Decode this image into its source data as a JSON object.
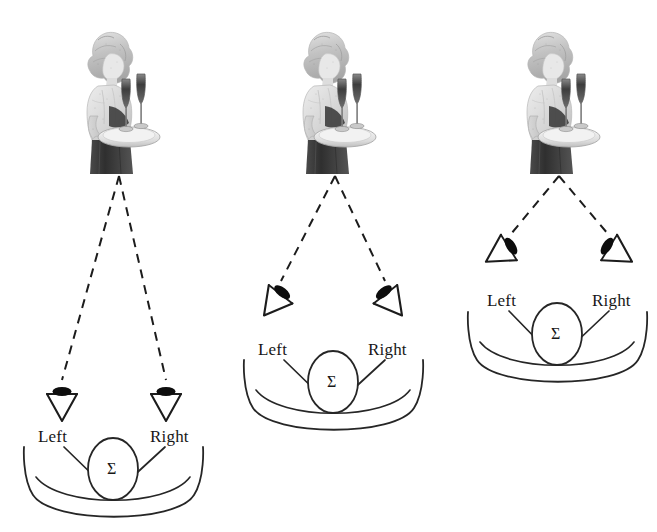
{
  "figure": {
    "background_color": "#ffffff",
    "ink_color": "#1c1c1c",
    "width": 657,
    "height": 532
  },
  "panels": [
    {
      "id": "panel-spaced-pair",
      "source": {
        "icon": "waitress-with-champagne-tray-photo",
        "x": 76,
        "y": 24,
        "w": 86,
        "h": 150,
        "apex_x": 119,
        "apex_y": 176
      },
      "mics": [
        {
          "side": "left",
          "label": "Left",
          "x": 62,
          "y": 395,
          "rotation_deg": 0
        },
        {
          "side": "right",
          "label": "Right",
          "x": 166,
          "y": 395,
          "rotation_deg": 0
        }
      ],
      "labels": {
        "left": {
          "text": "Left",
          "x": 38,
          "y": 427
        },
        "right": {
          "text": "Right",
          "x": 150,
          "y": 427
        }
      },
      "summing": {
        "symbol": "Σ",
        "cx": 113,
        "cy": 469,
        "rx": 25,
        "ry": 31
      },
      "listener_arc": {
        "cx": 113,
        "cy": 466,
        "rx": 90,
        "ry": 52
      }
    },
    {
      "id": "panel-near-coincident-pair",
      "source": {
        "icon": "waitress-with-champagne-tray-photo",
        "x": 292,
        "y": 24,
        "w": 86,
        "h": 150,
        "apex_x": 335,
        "apex_y": 176
      },
      "mics": [
        {
          "side": "left",
          "label": "Left",
          "x": 280,
          "y": 295,
          "rotation_deg": 38
        },
        {
          "side": "right",
          "label": "Right",
          "x": 386,
          "y": 295,
          "rotation_deg": -38
        }
      ],
      "labels": {
        "left": {
          "text": "Left",
          "x": 258,
          "y": 340
        },
        "right": {
          "text": "Right",
          "x": 368,
          "y": 340
        }
      },
      "summing": {
        "symbol": "Σ",
        "cx": 333,
        "cy": 382,
        "rx": 25,
        "ry": 31
      },
      "listener_arc": {
        "cx": 333,
        "cy": 379,
        "rx": 90,
        "ry": 52
      }
    },
    {
      "id": "panel-coincident-pair",
      "source": {
        "icon": "waitress-with-champagne-tray-photo",
        "x": 516,
        "y": 24,
        "w": 86,
        "h": 150,
        "apex_x": 559,
        "apex_y": 176
      },
      "mics": [
        {
          "side": "left",
          "label": "Left",
          "x": 508,
          "y": 248,
          "rotation_deg": 58
        },
        {
          "side": "right",
          "label": "Right",
          "x": 610,
          "y": 248,
          "rotation_deg": -58
        }
      ],
      "labels": {
        "left": {
          "text": "Left",
          "x": 487,
          "y": 291
        },
        "right": {
          "text": "Right",
          "x": 592,
          "y": 291
        }
      },
      "summing": {
        "symbol": "Σ",
        "cx": 557,
        "cy": 334,
        "rx": 25,
        "ry": 31
      },
      "listener_arc": {
        "cx": 557,
        "cy": 331,
        "rx": 90,
        "ry": 52
      }
    }
  ],
  "legend": {
    "mic_icon_name": "microphone-icon",
    "sum_symbol": "Σ",
    "dashed_ray_name": "sound-path-dashed-line"
  }
}
